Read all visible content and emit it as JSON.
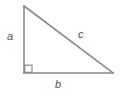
{
  "figure": {
    "type": "right-triangle-diagram",
    "background_color": "#ffffff",
    "stroke_color": "#8a8a8a",
    "label_color": "#4d4d4d",
    "stroke_width": 1.6,
    "canvas": {
      "width": 122,
      "height": 96
    },
    "vertices": {
      "top": {
        "x": 24,
        "y": 6
      },
      "bottom_left": {
        "x": 24,
        "y": 73
      },
      "bottom_right": {
        "x": 113,
        "y": 73
      }
    },
    "right_angle_marker": {
      "x": 24,
      "y": 65,
      "size": 8
    },
    "labels": {
      "vertical_leg": "a",
      "horizontal_leg": "b",
      "hypotenuse": "c"
    }
  }
}
